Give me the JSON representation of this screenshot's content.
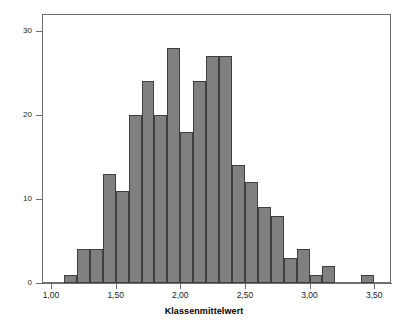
{
  "chart_data": {
    "type": "bar",
    "title": "",
    "subtitle": "",
    "xlabel": "Klassenmittelwert",
    "ylabel": "Häufigkeit",
    "xlim": [
      0.93,
      3.63
    ],
    "ylim": [
      0,
      32
    ],
    "grid": false,
    "legend": null,
    "bin_width": 0.1,
    "x_tick_labels": [
      "1,00",
      "1,50",
      "2,00",
      "2,50",
      "3,00",
      "3,50"
    ],
    "x_tick_values": [
      1.0,
      1.5,
      2.0,
      2.5,
      3.0,
      3.5
    ],
    "y_tick_labels": [
      "0",
      "10",
      "20",
      "30"
    ],
    "y_tick_values": [
      0,
      10,
      20,
      30
    ],
    "bar_color": "#808080",
    "bar_edge_color": "#3f3f3f",
    "axis_color": "#6e6e6e",
    "bins": [
      {
        "left": 1.1,
        "right": 1.2,
        "center": 1.15,
        "value": 1
      },
      {
        "left": 1.2,
        "right": 1.3,
        "center": 1.25,
        "value": 4
      },
      {
        "left": 1.3,
        "right": 1.4,
        "center": 1.35,
        "value": 4
      },
      {
        "left": 1.4,
        "right": 1.5,
        "center": 1.45,
        "value": 13
      },
      {
        "left": 1.5,
        "right": 1.6,
        "center": 1.55,
        "value": 11
      },
      {
        "left": 1.6,
        "right": 1.7,
        "center": 1.65,
        "value": 20
      },
      {
        "left": 1.7,
        "right": 1.8,
        "center": 1.75,
        "value": 24
      },
      {
        "left": 1.8,
        "right": 1.9,
        "center": 1.85,
        "value": 20
      },
      {
        "left": 1.9,
        "right": 2.0,
        "center": 1.95,
        "value": 28
      },
      {
        "left": 2.0,
        "right": 2.1,
        "center": 2.05,
        "value": 18
      },
      {
        "left": 2.1,
        "right": 2.2,
        "center": 2.15,
        "value": 24
      },
      {
        "left": 2.2,
        "right": 2.3,
        "center": 2.25,
        "value": 27
      },
      {
        "left": 2.3,
        "right": 2.4,
        "center": 2.35,
        "value": 27
      },
      {
        "left": 2.4,
        "right": 2.5,
        "center": 2.45,
        "value": 14
      },
      {
        "left": 2.5,
        "right": 2.6,
        "center": 2.55,
        "value": 12
      },
      {
        "left": 2.6,
        "right": 2.7,
        "center": 2.65,
        "value": 9
      },
      {
        "left": 2.7,
        "right": 2.8,
        "center": 2.75,
        "value": 8
      },
      {
        "left": 2.8,
        "right": 2.9,
        "center": 2.85,
        "value": 3
      },
      {
        "left": 2.9,
        "right": 3.0,
        "center": 2.95,
        "value": 4
      },
      {
        "left": 3.0,
        "right": 3.1,
        "center": 3.05,
        "value": 1
      },
      {
        "left": 3.1,
        "right": 3.2,
        "center": 3.15,
        "value": 2
      },
      {
        "left": 3.4,
        "right": 3.5,
        "center": 3.45,
        "value": 1
      }
    ],
    "categories": [
      "1.15",
      "1.25",
      "1.35",
      "1.45",
      "1.55",
      "1.65",
      "1.75",
      "1.85",
      "1.95",
      "2.05",
      "2.15",
      "2.25",
      "2.35",
      "2.45",
      "2.55",
      "2.65",
      "2.75",
      "2.85",
      "2.95",
      "3.05",
      "3.15",
      "3.45"
    ],
    "values": [
      1,
      4,
      4,
      13,
      11,
      20,
      24,
      20,
      28,
      18,
      24,
      27,
      27,
      14,
      12,
      9,
      8,
      3,
      4,
      1,
      2,
      1
    ]
  }
}
